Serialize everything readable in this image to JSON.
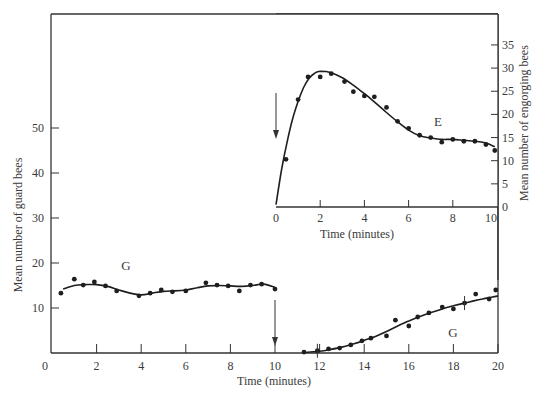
{
  "chart_data": [
    {
      "id": "main",
      "type": "scatter",
      "title": "",
      "xlabel": "Time (minutes)",
      "ylabel": "Mean number of guard bees",
      "xlim": [
        0,
        20
      ],
      "ylim": [
        0,
        60
      ],
      "xticks": [
        0,
        2,
        4,
        6,
        8,
        10,
        12,
        14,
        16,
        18,
        20
      ],
      "yticks": [
        10,
        20,
        30,
        40,
        50
      ],
      "grid": false,
      "annotations": [
        {
          "text": "G",
          "x": 3.3,
          "y": 19.5
        },
        {
          "text": "G",
          "x": 18.2,
          "y": 7.5
        },
        {
          "type": "arrow",
          "x": 10,
          "from_y": 12,
          "to_y": 1,
          "description": "downward arrow at 10 min"
        }
      ],
      "series": [
        {
          "name": "G (before, 0-10 min)",
          "points": [
            [
              0.4,
              13.3
            ],
            [
              1.0,
              16.4
            ],
            [
              1.4,
              15.1
            ],
            [
              1.9,
              15.8
            ],
            [
              2.4,
              14.9
            ],
            [
              2.9,
              13.8
            ],
            [
              3.9,
              12.7
            ],
            [
              4.4,
              13.3
            ],
            [
              4.9,
              14.0
            ],
            [
              5.4,
              13.6
            ],
            [
              6.0,
              13.8
            ],
            [
              6.9,
              15.6
            ],
            [
              7.4,
              15.1
            ],
            [
              7.9,
              14.9
            ],
            [
              8.4,
              13.8
            ],
            [
              8.9,
              15.1
            ],
            [
              9.4,
              15.3
            ],
            [
              10.0,
              14.2
            ]
          ],
          "curve": [
            [
              0.5,
              14.2
            ],
            [
              1.0,
              15.0
            ],
            [
              1.5,
              15.2
            ],
            [
              2.0,
              15.2
            ],
            [
              2.5,
              14.8
            ],
            [
              3.0,
              14.0
            ],
            [
              3.5,
              13.3
            ],
            [
              4.0,
              12.9
            ],
            [
              4.5,
              13.3
            ],
            [
              5.0,
              13.7
            ],
            [
              5.5,
              13.8
            ],
            [
              6.0,
              14.0
            ],
            [
              6.5,
              14.5
            ],
            [
              7.0,
              14.9
            ],
            [
              7.5,
              15.0
            ],
            [
              8.0,
              14.9
            ],
            [
              8.5,
              14.8
            ],
            [
              9.0,
              15.0
            ],
            [
              9.5,
              15.3
            ],
            [
              10.0,
              14.6
            ]
          ]
        },
        {
          "name": "G (after, 11-20 min)",
          "points": [
            [
              11.3,
              0.2
            ],
            [
              11.9,
              0.5
            ],
            [
              12.4,
              0.9
            ],
            [
              12.9,
              1.1
            ],
            [
              13.4,
              1.8
            ],
            [
              13.9,
              2.7
            ],
            [
              14.3,
              3.3
            ],
            [
              15.0,
              3.8
            ],
            [
              15.4,
              7.3
            ],
            [
              16.0,
              6.0
            ],
            [
              16.4,
              8.0
            ],
            [
              16.9,
              8.9
            ],
            [
              17.5,
              10.2
            ],
            [
              18.0,
              9.8
            ],
            [
              18.5,
              11.1
            ],
            [
              19.0,
              13.1
            ],
            [
              19.6,
              12.0
            ],
            [
              19.9,
              14.0
            ]
          ],
          "curve": [
            [
              11.3,
              0.1
            ],
            [
              12.0,
              0.4
            ],
            [
              12.5,
              0.8
            ],
            [
              13.0,
              1.3
            ],
            [
              13.5,
              2.0
            ],
            [
              14.0,
              2.8
            ],
            [
              14.5,
              3.7
            ],
            [
              15.0,
              4.8
            ],
            [
              15.5,
              6.0
            ],
            [
              16.0,
              7.1
            ],
            [
              16.5,
              8.1
            ],
            [
              17.0,
              9.0
            ],
            [
              17.5,
              9.8
            ],
            [
              18.0,
              10.5
            ],
            [
              18.5,
              11.1
            ],
            [
              19.0,
              11.7
            ],
            [
              19.5,
              12.2
            ],
            [
              20.0,
              12.7
            ]
          ],
          "error_marks": [
            [
              11.9,
              0.5
            ],
            [
              18.5,
              11.1
            ]
          ]
        }
      ]
    },
    {
      "id": "inset",
      "type": "scatter",
      "title": "",
      "xlabel": "Time (minutes)",
      "ylabel": "Mean number of engorging bees",
      "xlim": [
        0,
        10
      ],
      "ylim": [
        0,
        35
      ],
      "xticks": [
        0,
        2,
        4,
        6,
        8,
        10
      ],
      "yticks": [
        0,
        5,
        10,
        15,
        20,
        25,
        30,
        35
      ],
      "grid": false,
      "y_axis_side": "right",
      "annotations": [
        {
          "text": "E",
          "x": 7.2,
          "y": 18.5
        },
        {
          "type": "arrow",
          "x": 0,
          "from_y": 25,
          "to_y": 14,
          "description": "downward arrow at 0 min"
        }
      ],
      "series": [
        {
          "name": "E",
          "points": [
            [
              0.45,
              10.3
            ],
            [
              1.0,
              23.2
            ],
            [
              1.45,
              28.1
            ],
            [
              2.0,
              28.1
            ],
            [
              2.5,
              28.8
            ],
            [
              3.1,
              27.1
            ],
            [
              3.5,
              24.9
            ],
            [
              4.0,
              24.0
            ],
            [
              4.45,
              23.8
            ],
            [
              5.0,
              21.5
            ],
            [
              5.5,
              18.5
            ],
            [
              6.0,
              17.0
            ],
            [
              6.5,
              15.5
            ],
            [
              7.0,
              15.0
            ],
            [
              7.5,
              14.0
            ],
            [
              8.0,
              14.6
            ],
            [
              8.5,
              14.2
            ],
            [
              9.0,
              14.2
            ],
            [
              9.5,
              13.5
            ],
            [
              9.9,
              12.2
            ]
          ],
          "curve": [
            [
              0.0,
              0.5
            ],
            [
              0.25,
              8.0
            ],
            [
              0.5,
              14.0
            ],
            [
              0.75,
              19.0
            ],
            [
              1.0,
              22.8
            ],
            [
              1.25,
              25.8
            ],
            [
              1.5,
              27.8
            ],
            [
              1.75,
              28.9
            ],
            [
              2.0,
              29.3
            ],
            [
              2.5,
              29.0
            ],
            [
              3.0,
              27.9
            ],
            [
              3.5,
              26.3
            ],
            [
              4.0,
              24.5
            ],
            [
              4.5,
              22.5
            ],
            [
              5.0,
              20.4
            ],
            [
              5.5,
              18.4
            ],
            [
              6.0,
              16.6
            ],
            [
              6.5,
              15.4
            ],
            [
              7.0,
              14.9
            ],
            [
              7.5,
              14.6
            ],
            [
              8.0,
              14.6
            ],
            [
              8.5,
              14.4
            ],
            [
              9.0,
              14.2
            ],
            [
              9.5,
              13.8
            ],
            [
              9.9,
              13.0
            ]
          ]
        }
      ]
    }
  ],
  "labels": {
    "main_xlabel": "Time (minutes)",
    "main_ylabel": "Mean number of guard bees",
    "inset_xlabel": "Time (minutes)",
    "inset_ylabel": "Mean number of engorging bees",
    "main_x_zero": "0",
    "series_label_g1": "G",
    "series_label_g2": "G",
    "series_label_e": "E"
  }
}
